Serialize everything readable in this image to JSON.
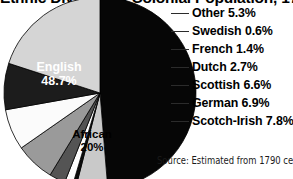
{
  "chart_data": {
    "type": "pie",
    "title": "Ethnic Division of Colonial Population, 1790",
    "source_note": "Source: Estimated from 1790 census",
    "categories": [
      "English",
      "Other",
      "Swedish",
      "French",
      "Dutch",
      "Scottish",
      "German",
      "Scotch-Irish",
      "African"
    ],
    "values": [
      48.7,
      5.3,
      0.6,
      1.4,
      2.7,
      6.6,
      6.9,
      7.8,
      20
    ],
    "unit": "%",
    "legend_position": "right",
    "grid": false,
    "slices": [
      {
        "name": "English",
        "value": 48.7,
        "display": "48.7%",
        "label": "English",
        "label_mode": "inside",
        "fill": "#060606",
        "text_color": "#ffffff"
      },
      {
        "name": "Other",
        "value": 5.3,
        "display": "5.3%",
        "label": "Other",
        "label_mode": "leader",
        "fill": "#c9c9c9",
        "text_color": "#000000"
      },
      {
        "name": "Swedish",
        "value": 0.6,
        "display": "0.6%",
        "label": "Swedish",
        "label_mode": "leader",
        "fill": "#0d0d0d",
        "text_color": "#000000"
      },
      {
        "name": "French",
        "value": 1.4,
        "display": "1.4%",
        "label": "French",
        "label_mode": "leader",
        "fill": "#fdfdfd",
        "text_color": "#000000"
      },
      {
        "name": "Dutch",
        "value": 2.7,
        "display": "2.7%",
        "label": "Dutch",
        "label_mode": "leader",
        "fill": "#545454",
        "text_color": "#000000"
      },
      {
        "name": "Scottish",
        "value": 6.6,
        "display": "6.6%",
        "label": "Scottish",
        "label_mode": "leader",
        "fill": "#9a9a9a",
        "text_color": "#000000"
      },
      {
        "name": "German",
        "value": 6.9,
        "display": "6.9%",
        "label": "German",
        "label_mode": "leader",
        "fill": "#fbfbfb",
        "text_color": "#000000"
      },
      {
        "name": "Scotch-Irish",
        "value": 7.8,
        "display": "7.8%",
        "label": "Scotch-Irish",
        "label_mode": "leader",
        "fill": "#1c1c1c",
        "text_color": "#000000"
      },
      {
        "name": "African",
        "value": 20,
        "display": "20%",
        "label": "African",
        "label_mode": "inside",
        "fill": "#d5d5d5",
        "text_color": "#000000"
      }
    ]
  },
  "title": "Ethnic Division of Colonial Population, 1790",
  "slice_labels": {
    "english_name": "English",
    "english_value": "48.7%",
    "african_name": "African",
    "african_value": "20%"
  },
  "legend": {
    "items": [
      {
        "label": "Other 5.3%"
      },
      {
        "label": "Swedish 0.6%"
      },
      {
        "label": "French 1.4%"
      },
      {
        "label": "Dutch 2.7%"
      },
      {
        "label": "Scottish 6.6%"
      },
      {
        "label": "German 6.9%"
      },
      {
        "label": "Scotch-Irish 7.8%"
      }
    ]
  },
  "source_note": "Source: Estimated from 1790 census",
  "colors": {
    "background": "#ffffff",
    "text": "#000000",
    "leader_line": "#2b2b2b"
  }
}
